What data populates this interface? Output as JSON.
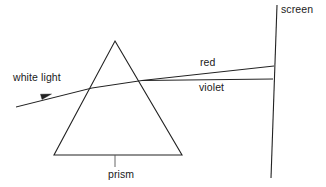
{
  "diagram": {
    "type": "optics-ray-diagram",
    "stroke_color": "#222222",
    "background_color": "#ffffff",
    "labels": {
      "white_light": "white light",
      "red": "red",
      "violet": "violet",
      "prism": "prism",
      "screen": "screen"
    },
    "geometry": {
      "prism_apex": [
        115,
        41
      ],
      "prism_bottom_left": [
        54,
        155
      ],
      "prism_bottom_right": [
        182,
        155
      ],
      "incident_ray_start": [
        16,
        107
      ],
      "incident_ray_arrow_tip": [
        50,
        95
      ],
      "entry_point": [
        92,
        88
      ],
      "red_exit_point": [
        140,
        81
      ],
      "red_screen_hit": [
        274,
        66
      ],
      "violet_exit_point": [
        140,
        81
      ],
      "violet_screen_hit": [
        273,
        79
      ],
      "screen_top": [
        277,
        5
      ],
      "screen_bottom": [
        271,
        178
      ],
      "prism_leader_x": 115,
      "prism_leader_top": 155,
      "prism_leader_bottom": 167
    }
  }
}
